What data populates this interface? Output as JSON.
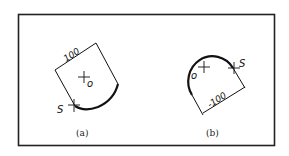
{
  "figure": {
    "frame": {
      "stroke": "#222222"
    },
    "panels": [
      {
        "id": "a",
        "caption": "(a)",
        "center_label": "o",
        "start_label": "S",
        "dimension_label": "100"
      },
      {
        "id": "b",
        "caption": "(b)",
        "center_label": "o",
        "start_label": "S",
        "dimension_label": "-100"
      }
    ]
  }
}
